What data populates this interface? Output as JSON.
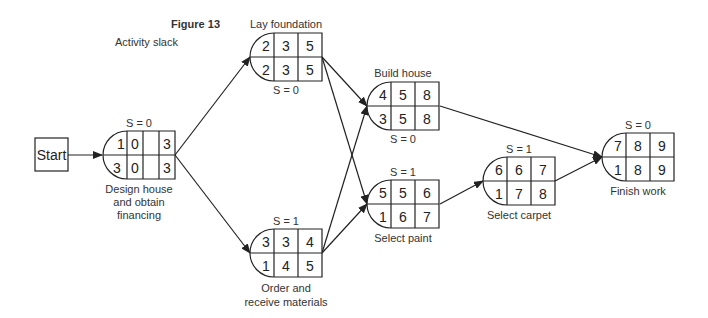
{
  "figure": {
    "title": "Figure 13",
    "subtitle": "Activity slack"
  },
  "start": {
    "label": "Start"
  },
  "nodes": [
    {
      "id": "design",
      "label_lines": [
        "Design house",
        "and obtain",
        "financing"
      ],
      "slack": "S = 0",
      "slack_position": "top",
      "top": [
        "1",
        "0",
        "3"
      ],
      "bottom": [
        "3",
        "0",
        "3"
      ]
    },
    {
      "id": "foundation",
      "label_lines": [
        "Lay foundation"
      ],
      "label_position": "top",
      "slack": "S = 0",
      "slack_position": "bottom",
      "top": [
        "2",
        "3",
        "5"
      ],
      "bottom": [
        "2",
        "3",
        "5"
      ]
    },
    {
      "id": "materials",
      "label_lines": [
        "Order and",
        "receive materials"
      ],
      "slack": "S = 1",
      "slack_position": "top",
      "top": [
        "3",
        "3",
        "4"
      ],
      "bottom": [
        "1",
        "4",
        "5"
      ]
    },
    {
      "id": "build",
      "label_lines": [
        "Build house"
      ],
      "label_position": "top",
      "slack": "S = 0",
      "slack_position": "bottom",
      "top": [
        "4",
        "5",
        "8"
      ],
      "bottom": [
        "3",
        "5",
        "8"
      ]
    },
    {
      "id": "paint",
      "label_lines": [
        "Select paint"
      ],
      "slack": "S = 1",
      "slack_position": "top",
      "top": [
        "5",
        "5",
        "6"
      ],
      "bottom": [
        "1",
        "6",
        "7"
      ]
    },
    {
      "id": "carpet",
      "label_lines": [
        "Select carpet"
      ],
      "slack": "S = 1",
      "slack_position": "top",
      "top": [
        "6",
        "6",
        "7"
      ],
      "bottom": [
        "1",
        "7",
        "8"
      ]
    },
    {
      "id": "finish",
      "label_lines": [
        "Finish work"
      ],
      "slack": "S = 0",
      "slack_position": "top",
      "top": [
        "7",
        "8",
        "9"
      ],
      "bottom": [
        "1",
        "8",
        "9"
      ]
    }
  ],
  "edges": [
    [
      "start",
      "design"
    ],
    [
      "design",
      "foundation"
    ],
    [
      "design",
      "materials"
    ],
    [
      "foundation",
      "build"
    ],
    [
      "foundation",
      "paint"
    ],
    [
      "materials",
      "build"
    ],
    [
      "materials",
      "paint"
    ],
    [
      "build",
      "finish"
    ],
    [
      "paint",
      "carpet"
    ],
    [
      "carpet",
      "finish"
    ]
  ]
}
